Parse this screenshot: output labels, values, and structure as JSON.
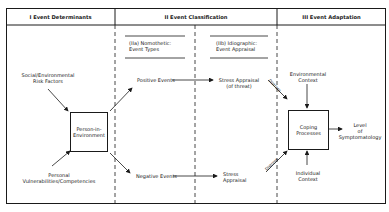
{
  "headers": {
    "col1": "I Event Determinants",
    "col2": "II Event Classification",
    "col3": "III Event Adaptation"
  },
  "subheaders": {
    "iia_line1": "(IIa) Nomothetic:",
    "iia_line2": "Event Types",
    "iib_line1": "(IIb) Idiographic:",
    "iib_line2": "Event Appraisal"
  },
  "nodes": {
    "social_line1": "Social/Environmental",
    "social_line2": "Risk Factors",
    "person_line1": "Person-in-",
    "person_line2": "Environment",
    "personal_line1": "Personal",
    "personal_line2": "Vulnerabilities/Competencies",
    "positive": "Positive Events",
    "negative": "Negative Events",
    "stress_threat_line1": "Stress Appraisal",
    "stress_threat_line2": "(of threat)",
    "stress_line1": "Stress",
    "stress_line2": "Appraisal",
    "env_line1": "Environmental",
    "env_line2": "Context",
    "coping_line1": "Coping",
    "coping_line2": "Processes",
    "level_line1": "Level",
    "level_line2": "of",
    "level_line3": "Symptomatology",
    "indiv_line1": "Individual",
    "indiv_line2": "Context"
  },
  "edge_labels": {
    "upper": "Distress",
    "lower": "Distress"
  }
}
